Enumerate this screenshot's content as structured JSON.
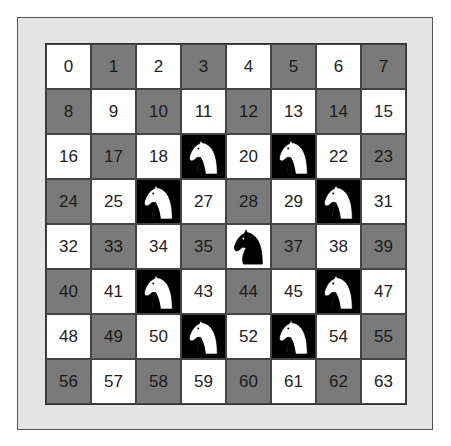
{
  "diagram": {
    "type": "chessboard-knight-moves",
    "rows": 8,
    "cols": 8,
    "colors": {
      "light": "#ffffff",
      "dark": "#7a7a7a",
      "frame": "#e4e4e4",
      "knight_square_bg": "#000000"
    },
    "center_knight": {
      "square": 36,
      "color": "black"
    },
    "target_knights": [
      {
        "square": 19,
        "color": "white"
      },
      {
        "square": 21,
        "color": "white"
      },
      {
        "square": 26,
        "color": "white"
      },
      {
        "square": 30,
        "color": "white"
      },
      {
        "square": 42,
        "color": "white"
      },
      {
        "square": 46,
        "color": "white"
      },
      {
        "square": 51,
        "color": "white"
      },
      {
        "square": 53,
        "color": "white"
      }
    ],
    "cells": [
      {
        "label": "0",
        "shade": "light"
      },
      {
        "label": "1",
        "shade": "dark"
      },
      {
        "label": "2",
        "shade": "light"
      },
      {
        "label": "3",
        "shade": "dark"
      },
      {
        "label": "4",
        "shade": "light"
      },
      {
        "label": "5",
        "shade": "dark"
      },
      {
        "label": "6",
        "shade": "light"
      },
      {
        "label": "7",
        "shade": "dark"
      },
      {
        "label": "8",
        "shade": "dark"
      },
      {
        "label": "9",
        "shade": "light"
      },
      {
        "label": "10",
        "shade": "dark"
      },
      {
        "label": "11",
        "shade": "light"
      },
      {
        "label": "12",
        "shade": "dark"
      },
      {
        "label": "13",
        "shade": "light"
      },
      {
        "label": "14",
        "shade": "dark"
      },
      {
        "label": "15",
        "shade": "light"
      },
      {
        "label": "16",
        "shade": "light"
      },
      {
        "label": "17",
        "shade": "dark"
      },
      {
        "label": "18",
        "shade": "light"
      },
      {
        "label": "",
        "shade": "knight-white"
      },
      {
        "label": "20",
        "shade": "light"
      },
      {
        "label": "",
        "shade": "knight-white"
      },
      {
        "label": "22",
        "shade": "light"
      },
      {
        "label": "23",
        "shade": "dark"
      },
      {
        "label": "24",
        "shade": "dark"
      },
      {
        "label": "25",
        "shade": "light"
      },
      {
        "label": "",
        "shade": "knight-white"
      },
      {
        "label": "27",
        "shade": "light"
      },
      {
        "label": "28",
        "shade": "dark"
      },
      {
        "label": "29",
        "shade": "light"
      },
      {
        "label": "",
        "shade": "knight-white"
      },
      {
        "label": "31",
        "shade": "light"
      },
      {
        "label": "32",
        "shade": "light"
      },
      {
        "label": "33",
        "shade": "dark"
      },
      {
        "label": "34",
        "shade": "light"
      },
      {
        "label": "35",
        "shade": "dark"
      },
      {
        "label": "",
        "shade": "knight-black"
      },
      {
        "label": "37",
        "shade": "dark"
      },
      {
        "label": "38",
        "shade": "light"
      },
      {
        "label": "39",
        "shade": "dark"
      },
      {
        "label": "40",
        "shade": "dark"
      },
      {
        "label": "41",
        "shade": "light"
      },
      {
        "label": "",
        "shade": "knight-white"
      },
      {
        "label": "43",
        "shade": "light"
      },
      {
        "label": "44",
        "shade": "dark"
      },
      {
        "label": "45",
        "shade": "light"
      },
      {
        "label": "",
        "shade": "knight-white"
      },
      {
        "label": "47",
        "shade": "light"
      },
      {
        "label": "48",
        "shade": "light"
      },
      {
        "label": "49",
        "shade": "dark"
      },
      {
        "label": "50",
        "shade": "light"
      },
      {
        "label": "",
        "shade": "knight-white"
      },
      {
        "label": "52",
        "shade": "light"
      },
      {
        "label": "",
        "shade": "knight-white"
      },
      {
        "label": "54",
        "shade": "light"
      },
      {
        "label": "55",
        "shade": "dark"
      },
      {
        "label": "56",
        "shade": "dark"
      },
      {
        "label": "57",
        "shade": "light"
      },
      {
        "label": "58",
        "shade": "dark"
      },
      {
        "label": "59",
        "shade": "light"
      },
      {
        "label": "60",
        "shade": "dark"
      },
      {
        "label": "61",
        "shade": "light"
      },
      {
        "label": "62",
        "shade": "dark"
      },
      {
        "label": "63",
        "shade": "light"
      }
    ]
  }
}
